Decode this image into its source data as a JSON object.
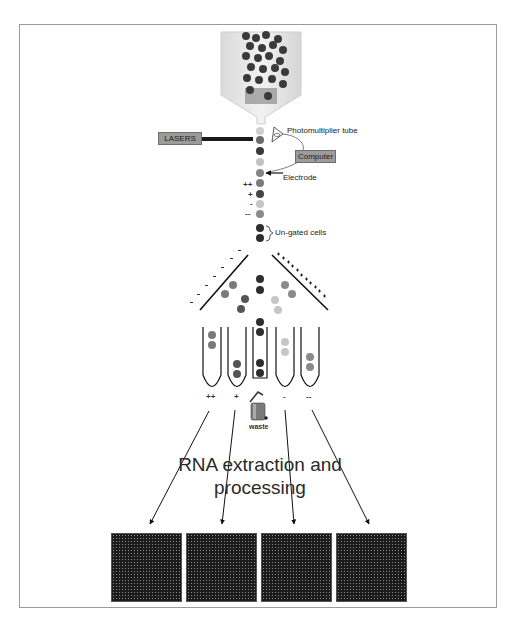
{
  "diagram": {
    "labels": {
      "lasers": "LASERS",
      "photomultiplier": "Photomultiplier tube",
      "computer": "Computer",
      "electrode": "Electrode",
      "ungated": "Un-gated cells",
      "waste": "waste",
      "rna_line1": "RNA extraction and",
      "rna_line2": "processing"
    },
    "charge_signs": {
      "stream": [
        "++",
        "+",
        "-",
        "--"
      ],
      "tubes": [
        "++",
        "+",
        "-",
        "--"
      ]
    },
    "plates": {
      "left_sign": "-",
      "right_sign": "+"
    },
    "microarrays": [
      {
        "id": "array-1",
        "group": "++"
      },
      {
        "id": "array-2",
        "group": "+"
      },
      {
        "id": "array-3",
        "group": "-"
      },
      {
        "id": "array-4",
        "group": "--"
      }
    ],
    "colors": {
      "frame": "#9a9a9a",
      "box_fill": "#9b9b9b",
      "cell_dark": "#2e2e2e",
      "cell_mid": "#6a6a6a",
      "cell_light": "#bdbdbd",
      "cell_gray": "#858585",
      "funnel": "#e3e3e3"
    }
  }
}
